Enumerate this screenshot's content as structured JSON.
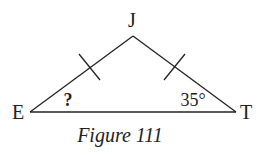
{
  "figure": {
    "caption": "Figure 111",
    "vertices": {
      "E": {
        "label": "E"
      },
      "J": {
        "label": "J"
      },
      "T": {
        "label": "T"
      }
    },
    "angles": {
      "E": "?",
      "T": "35°"
    },
    "congruent_sides": [
      "EJ",
      "JT"
    ]
  }
}
